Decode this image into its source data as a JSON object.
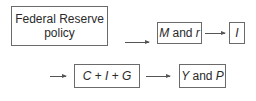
{
  "diagram": {
    "type": "flowchart",
    "rows": [
      {
        "nodes": [
          {
            "id": "fed",
            "label_line1": "Federal Reserve",
            "label_line2": "policy"
          },
          {
            "id": "mr",
            "parts": [
              {
                "text": "M",
                "italic": true
              },
              {
                "text": " and ",
                "italic": false
              },
              {
                "text": "r",
                "italic": true
              }
            ]
          },
          {
            "id": "inv",
            "parts": [
              {
                "text": "I",
                "italic": true
              }
            ]
          }
        ]
      },
      {
        "leading_arrow": true,
        "nodes": [
          {
            "id": "agg",
            "parts": [
              {
                "text": "C",
                "italic": true
              },
              {
                "text": " + ",
                "italic": false
              },
              {
                "text": "I",
                "italic": true
              },
              {
                "text": " + ",
                "italic": false
              },
              {
                "text": "G",
                "italic": true
              }
            ]
          },
          {
            "id": "yp",
            "parts": [
              {
                "text": "Y",
                "italic": true
              },
              {
                "text": " and ",
                "italic": false
              },
              {
                "text": "P",
                "italic": true
              }
            ]
          }
        ]
      }
    ],
    "edges": [
      {
        "from": "fed",
        "to": "mr"
      },
      {
        "from": "mr",
        "to": "inv"
      },
      {
        "from": "inv",
        "to": "agg"
      },
      {
        "from": "agg",
        "to": "yp"
      }
    ],
    "colors": {
      "border": "#6a6a6a",
      "arrow": "#555555",
      "text": "#2a2a2a",
      "background": "#ffffff"
    }
  }
}
